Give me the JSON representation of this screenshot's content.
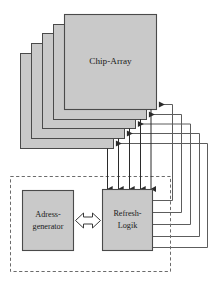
{
  "diagram": {
    "blocks": {
      "chip_array": {
        "label": "Chip-Array",
        "layers": 5,
        "fill": "#c9c9c9",
        "stroke": "#4a4a4a"
      },
      "adress_generator": {
        "label_line1": "Adress-",
        "label_line2": "generator",
        "fill": "#c9c9c9",
        "stroke": "#4a4a4a"
      },
      "refresh_logik": {
        "label_line1": "Refresh-",
        "label_line2": "Logik",
        "fill": "#c9c9c9",
        "stroke": "#4a4a4a"
      }
    },
    "grouping_box": {
      "style": "dashed",
      "stroke": "#6b6b6b"
    },
    "connections": {
      "bus_arrow": {
        "name": "bidirectional-bus",
        "direction": "bidirectional",
        "fill": "#ffffff",
        "stroke": "#3a3a3a"
      },
      "refresh_lines": {
        "count": 5,
        "description": "Refresh-Logik to Chip-Array layers",
        "stroke": "#5d5d5d"
      },
      "down_arrows": {
        "count": 5,
        "description": "Signals into Refresh-Logik",
        "stroke": "#2b2b2b"
      }
    },
    "colors": {
      "block_fill": "#c9c9c9",
      "block_stroke": "#4a4a4a",
      "line": "#5d5d5d",
      "dark_line": "#2b2b2b",
      "dashed": "#6b6b6b",
      "background": "#ffffff",
      "text": "#1a1a1a"
    }
  }
}
